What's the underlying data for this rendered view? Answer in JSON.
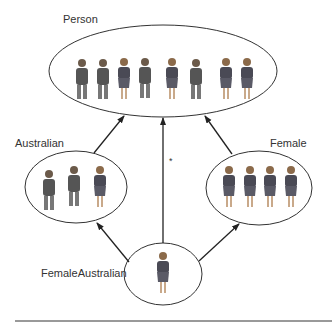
{
  "diagram": {
    "nodes": [
      {
        "id": "person",
        "label": "Person",
        "cx": 163,
        "cy": 71,
        "rx": 114,
        "ry": 46,
        "label_x": 63,
        "label_y": 13,
        "figures": 8
      },
      {
        "id": "australian",
        "label": "Australian",
        "cx": 76,
        "cy": 187,
        "rx": 51,
        "ry": 36,
        "label_x": 15,
        "label_y": 138,
        "figures": 3
      },
      {
        "id": "female",
        "label": "Female",
        "cx": 259,
        "cy": 188,
        "rx": 53,
        "ry": 37,
        "label_x": 270,
        "label_y": 138,
        "figures": 4
      },
      {
        "id": "femaleaustralian",
        "label": "FemaleAustralian",
        "cx": 163,
        "cy": 274,
        "rx": 39,
        "ry": 31,
        "label_x": 41,
        "label_y": 267,
        "figures": 1
      }
    ],
    "edges": [
      {
        "from": "australian",
        "to": "person"
      },
      {
        "from": "femaleaustralian",
        "to": "person"
      },
      {
        "from": "female",
        "to": "person"
      },
      {
        "from": "femaleaustralian",
        "to": "australian"
      },
      {
        "from": "femaleaustralian",
        "to": "female"
      }
    ],
    "annotation": "*",
    "colors": {
      "stroke": "#333333",
      "figure": "#555555",
      "accent": "#8a8a8a"
    }
  }
}
